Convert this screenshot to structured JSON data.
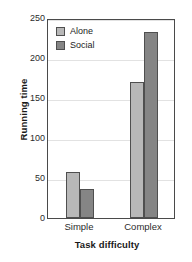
{
  "chart_data": {
    "type": "bar",
    "title": "",
    "xlabel": "Task difficulty",
    "ylabel": "Running time",
    "categories": [
      "Simple",
      "Complex"
    ],
    "series": [
      {
        "name": "Alone",
        "values": [
          58,
          170
        ],
        "color": "#b8b8b8"
      },
      {
        "name": "Social",
        "values": [
          36,
          233
        ],
        "color": "#858585"
      }
    ],
    "ylim": [
      0,
      250
    ],
    "yticks": [
      0,
      50,
      100,
      150,
      200,
      250
    ],
    "ytick_labels": [
      "0",
      "50",
      "100",
      "150",
      "200",
      "250"
    ],
    "grid": true,
    "grid_axis": "y",
    "legend_position": "upper-left-inside",
    "legend_entries": [
      "Alone",
      "Social"
    ],
    "bar_border_color": "#4f4f4f",
    "axis_color": "#4a4a4a",
    "gridline_color": "#e2e2e2",
    "background": "#ffffff"
  }
}
